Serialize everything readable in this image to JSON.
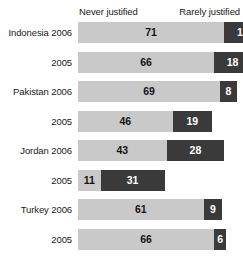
{
  "chart_data": {
    "type": "bar",
    "subtype": "stacked-horizontal",
    "title": "",
    "xlabel": "",
    "ylabel": "",
    "grid": false,
    "legend_position": "top",
    "categories": [
      "Indonesia 2006",
      "2005",
      "Pakistan 2006",
      "2005",
      "Jordan 2006",
      "2005",
      "Turkey 2006",
      "2005"
    ],
    "series": [
      {
        "name": "Never justified",
        "color": "#c9c9c9",
        "values": [
          71,
          66,
          69,
          46,
          43,
          11,
          61,
          66
        ]
      },
      {
        "name": "Rarely justified",
        "color": "#3a3a3a",
        "values": [
          18,
          18,
          8,
          19,
          28,
          31,
          9,
          6
        ]
      }
    ],
    "value_labels": [
      [
        "71",
        "18"
      ],
      [
        "66",
        "18"
      ],
      [
        "69",
        "8"
      ],
      [
        "46",
        "19"
      ],
      [
        "43",
        "28"
      ],
      [
        "11",
        "31"
      ],
      [
        "61",
        "9"
      ],
      [
        "66",
        "6"
      ]
    ]
  },
  "legend": {
    "never": "Never justified",
    "rarely": "Rarely justified"
  },
  "colors": {
    "never": "#c9c9c9",
    "rarely": "#3a3a3a",
    "background": "#ffffff",
    "text": "#1a1a1a"
  }
}
